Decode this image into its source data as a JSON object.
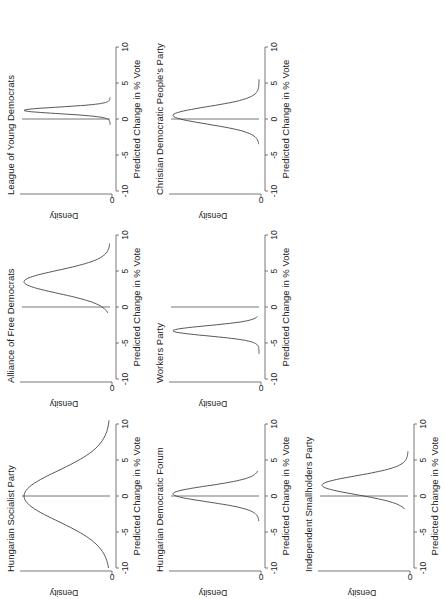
{
  "figure": {
    "orientation": "rotated 90 degrees counter-clockwise",
    "panels": [
      {
        "title": "Hungarian Socialist Party",
        "xlabel": "Predicted Change in % Vote",
        "ylabel": "Density"
      },
      {
        "title": "Alliance of Free Democrats",
        "xlabel": "Predicted Change in % Vote",
        "ylabel": "Density"
      },
      {
        "title": "League of Young Democrats",
        "xlabel": "Predicted Change in % Vote",
        "ylabel": "Density"
      },
      {
        "title": "Hungarian Democratic Forum",
        "xlabel": "Predicted Change in % Vote",
        "ylabel": "Density"
      },
      {
        "title": "Workers Party",
        "xlabel": "Predicted Change in % Vote",
        "ylabel": "Density"
      },
      {
        "title": "Christian Democratic People's Party",
        "xlabel": "Predicted Change in % Vote",
        "ylabel": "Density"
      },
      {
        "title": "Independent Smallholders Party",
        "xlabel": "Predicted Change in % Vote",
        "ylabel": "Density"
      }
    ],
    "xticks": [
      "-10",
      "-5",
      "0",
      "5",
      "10"
    ],
    "ytick": "0"
  },
  "chart_data": {
    "type": "line",
    "xlabel": "Predicted Change in % Vote",
    "ylabel": "Density",
    "xlim": [
      -10,
      10
    ],
    "yticks": [
      0
    ],
    "reference_line_x": 0,
    "layout": "3x3 grid (7 panels), figure rotated 90 degrees counter-clockwise",
    "series": [
      {
        "name": "Hungarian Socialist Party",
        "mean": 0.0,
        "sd": 3.5,
        "range": [
          -10,
          10.5
        ],
        "peak_rel_height": 1.0
      },
      {
        "name": "Alliance of Free Democrats",
        "mean": 3.5,
        "sd": 1.6,
        "range": [
          -0.8,
          8.8
        ],
        "peak_rel_height": 1.0
      },
      {
        "name": "League of Young Democrats",
        "mean": 1.2,
        "sd": 0.45,
        "range": [
          -0.8,
          3.0
        ],
        "peak_rel_height": 1.0
      },
      {
        "name": "Hungarian Democratic Forum",
        "mean": 0.3,
        "sd": 1.1,
        "range": [
          -3.5,
          3.5
        ],
        "peak_rel_height": 1.0
      },
      {
        "name": "Workers Party",
        "mean": -3.3,
        "sd": 0.7,
        "range": [
          -6.5,
          -1.3
        ],
        "peak_rel_height": 1.0
      },
      {
        "name": "Christian Democratic People's Party",
        "mean": 0.5,
        "sd": 1.2,
        "range": [
          -3.5,
          5.5
        ],
        "peak_rel_height": 1.0
      },
      {
        "name": "Independent Smallholders Party",
        "mean": 1.5,
        "sd": 1.3,
        "range": [
          -1.8,
          6.2
        ],
        "peak_rel_height": 1.0
      }
    ]
  }
}
